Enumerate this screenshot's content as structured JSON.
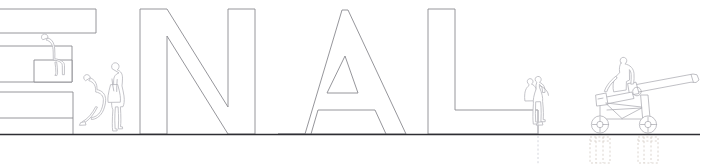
{
  "drawing": {
    "kind": "architectural-elevation",
    "title": "FINAL",
    "visible_text": "",
    "canvas": {
      "width": 721,
      "height": 164
    },
    "colors": {
      "background": "#ffffff",
      "letter_stroke": "#8a8a90",
      "figure_stroke": "#b9b9bf",
      "ground_stroke": "#2e2e33",
      "cannon_stroke": "#b0b0b6",
      "footing_warm": "#d2c9c2",
      "footing_cool": "#c9ccd4"
    },
    "ground": {
      "label": "ground-line",
      "y": 134,
      "x_start": 0,
      "x_end": 700
    },
    "letters": [
      {
        "id": "letter-E",
        "glyph": "E",
        "cropped_at_left_edge": true,
        "x": 0,
        "width": 96
      },
      {
        "id": "letter-N",
        "glyph": "N",
        "cropped_at_left_edge": false,
        "x": 140,
        "width": 122
      },
      {
        "id": "letter-A",
        "glyph": "A",
        "cropped_at_left_edge": false,
        "x": 278,
        "width": 128
      },
      {
        "id": "letter-L",
        "glyph": "L",
        "cropped_at_left_edge": false,
        "x": 428,
        "width": 110
      }
    ],
    "figures": [
      {
        "id": "figure-seated-on-E-crossbar",
        "pose": "seated",
        "location": "on E middle bar"
      },
      {
        "id": "figure-leaning-on-E-base",
        "pose": "seated-leaning",
        "location": "on E lower bar"
      },
      {
        "id": "figure-standing-woman",
        "pose": "standing",
        "location": "between E and N"
      },
      {
        "id": "figure-seated-pair-on-L",
        "pose": "seated-pair",
        "location": "on L foot"
      },
      {
        "id": "figure-standing-at-cannon",
        "pose": "standing",
        "location": "behind cannon"
      }
    ],
    "objects": [
      {
        "id": "field-cannon",
        "name": "field artillery cannon",
        "wheels": 2,
        "barrel_angle_deg": -12
      }
    ],
    "footings": [
      {
        "id": "footing-under-L-stem",
        "style": "dashed-vertical-line",
        "x": 538
      },
      {
        "id": "footing-under-front-wheel",
        "style": "dashed-block",
        "x": 598
      },
      {
        "id": "footing-under-rear-wheel",
        "style": "dashed-block",
        "x": 648
      }
    ]
  }
}
